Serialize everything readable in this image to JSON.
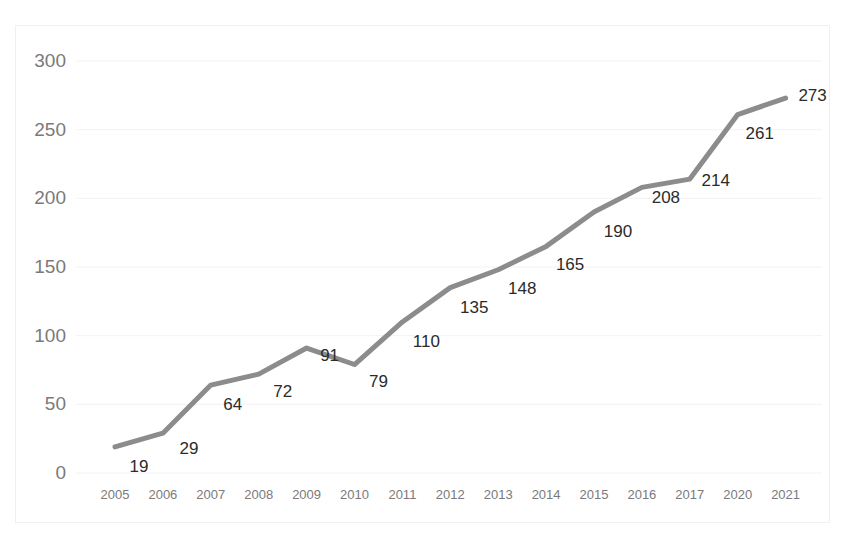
{
  "chart_data": {
    "type": "line",
    "title": "",
    "subtitle": "",
    "xlabel": "",
    "ylabel": "",
    "categories": [
      "2005",
      "2006",
      "2007",
      "2008",
      "2009",
      "2010",
      "2011",
      "2012",
      "2013",
      "2014",
      "2015",
      "2016",
      "2017",
      "2020",
      "2021"
    ],
    "values": [
      19,
      29,
      64,
      72,
      91,
      79,
      110,
      135,
      148,
      165,
      190,
      208,
      214,
      261,
      273
    ],
    "series": [
      {
        "name": "",
        "values": [
          19,
          29,
          64,
          72,
          91,
          79,
          110,
          135,
          148,
          165,
          190,
          208,
          214,
          261,
          273
        ]
      }
    ],
    "data_labels": [
      "19",
      "29",
      "64",
      "72",
      "91",
      "79",
      "110",
      "135",
      "148",
      "165",
      "190",
      "208",
      "214",
      "261",
      "273"
    ],
    "y_ticks": [
      0,
      50,
      100,
      150,
      200,
      250,
      300
    ],
    "y_tick_labels": [
      "0",
      "50",
      "100",
      "150",
      "200",
      "250",
      "300"
    ],
    "ylim": [
      0,
      300
    ],
    "grid": true,
    "grid_axis": "y",
    "legend": false,
    "legend_position": "none",
    "line_color": "#8c8c8c",
    "line_width": 5,
    "markers": false,
    "axis_label_color": "#7a7a7a",
    "data_label_color": "#2b2b2b",
    "gridline_color": "#f2f2f2",
    "frame_color": "#f0f0f0",
    "background_color": "#ffffff"
  }
}
